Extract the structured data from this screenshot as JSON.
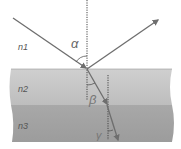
{
  "diagram": {
    "media": [
      {
        "label": "n1",
        "color": "#ffffff"
      },
      {
        "label": "n2",
        "color": "#c9c9c9"
      },
      {
        "label": "n3",
        "color": "#a6a6a6"
      }
    ],
    "angles": [
      {
        "symbol": "α",
        "meaning": "angle of incidence"
      },
      {
        "symbol": "β",
        "meaning": "refraction angle in n2"
      },
      {
        "symbol": "γ",
        "meaning": "refraction angle in n3"
      }
    ],
    "rays": [
      "incident",
      "reflected",
      "refracted-n2",
      "refracted-n3"
    ],
    "colors": {
      "ray": "#6e6e6e",
      "normal": "#444444",
      "label": "#555555"
    }
  }
}
